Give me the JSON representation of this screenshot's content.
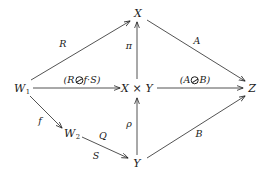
{
  "figure": {
    "kind": "commutative-diagram",
    "background": "#ffffff",
    "ink": "#1a1a1a",
    "width": 273,
    "height": 176
  },
  "nodes": {
    "w1": {
      "label": "W",
      "sub": "1",
      "x": 22,
      "y": 88
    },
    "w2": {
      "label": "W",
      "sub": "2",
      "x": 72,
      "y": 133
    },
    "x": {
      "label": "X",
      "x": 138,
      "y": 13
    },
    "xy": {
      "label": "X × Y",
      "x": 137,
      "y": 88
    },
    "y": {
      "label": "Y",
      "x": 137,
      "y": 163
    },
    "z": {
      "label": "Z",
      "x": 252,
      "y": 88
    }
  },
  "edges": [
    {
      "name": "w1-to-x",
      "from": "w1",
      "to": "x",
      "label": "R",
      "label_x": 63,
      "label_y": 44
    },
    {
      "name": "w1-to-xy",
      "from": "w1",
      "to": "xy",
      "label_parts": {
        "open": "(R",
        "operator": "circled-backslash",
        "close": "f·S)"
      },
      "label_text": "(R ⊘ f·S)",
      "label_x": 82,
      "label_y": 80
    },
    {
      "name": "w1-to-w2",
      "from": "w1",
      "to": "w2",
      "label": "f",
      "label_x": 40,
      "label_y": 121
    },
    {
      "name": "w2-to-y",
      "from": "w2",
      "to": "y",
      "label_above": "Q",
      "label_above_x": 103,
      "label_above_y": 136,
      "label_below": "S",
      "label_below_x": 96,
      "label_below_y": 156
    },
    {
      "name": "xy-to-x",
      "from": "xy",
      "to": "x",
      "label": "π",
      "label_x": 129,
      "label_y": 46
    },
    {
      "name": "y-to-xy",
      "from": "y",
      "to": "xy",
      "label": "ρ",
      "label_x": 129,
      "label_y": 124
    },
    {
      "name": "x-to-z",
      "from": "x",
      "to": "z",
      "label": "A",
      "label_x": 197,
      "label_y": 41
    },
    {
      "name": "xy-to-z",
      "from": "xy",
      "to": "z",
      "label_parts": {
        "open": "(A",
        "operator": "circled-backslash",
        "close": "B)"
      },
      "label_text": "(A ⊘ B)",
      "label_x": 195,
      "label_y": 80
    },
    {
      "name": "y-to-z",
      "from": "y",
      "to": "z",
      "label": "B",
      "label_x": 199,
      "label_y": 134
    }
  ]
}
